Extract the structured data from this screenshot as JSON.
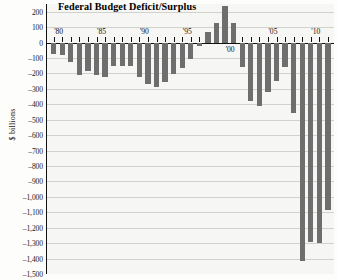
{
  "chart_data": {
    "type": "bar",
    "title": "Federal Budget Deficit/Surplus",
    "xlabel": "",
    "ylabel": "$ billions",
    "ylim": [
      -1500,
      250
    ],
    "ytick_step": 100,
    "grid": true,
    "legend": "none",
    "bar_color": "#6e6e6e",
    "plot_background": "#f6f6f4",
    "axis_color": "#111111",
    "ytick_labels": [
      "200",
      "100",
      "0",
      "–100",
      "–200",
      "–300",
      "–400",
      "–500",
      "–600",
      "–700",
      "–800",
      "–900",
      "–1,000",
      "–1,100",
      "–1,200",
      "–1,300",
      "–1,400",
      "–1,500"
    ],
    "ytick_values": [
      200,
      100,
      0,
      -100,
      -200,
      -300,
      -400,
      -500,
      -600,
      -700,
      -800,
      -900,
      -1000,
      -1100,
      -1200,
      -1300,
      -1400,
      -1500
    ],
    "xtick_labels": [
      "'80",
      "'85",
      "'90",
      "'95",
      "'00",
      "'05",
      "'10"
    ],
    "xtick_years": [
      1980,
      1985,
      1990,
      1995,
      2000,
      2005,
      2010
    ],
    "categories": [
      1980,
      1981,
      1982,
      1983,
      1984,
      1985,
      1986,
      1987,
      1988,
      1989,
      1990,
      1991,
      1992,
      1993,
      1994,
      1995,
      1996,
      1997,
      1998,
      1999,
      2000,
      2001,
      2002,
      2003,
      2004,
      2005,
      2006,
      2007,
      2008,
      2009,
      2010,
      2011,
      2012
    ],
    "values": [
      -74,
      -79,
      -128,
      -208,
      -185,
      -212,
      -221,
      -150,
      -155,
      -152,
      -221,
      -269,
      -290,
      -255,
      -203,
      -164,
      -107,
      -22,
      69,
      126,
      236,
      128,
      -158,
      -378,
      -413,
      -318,
      -248,
      -161,
      -459,
      -1413,
      -1294,
      -1300,
      -1087
    ]
  },
  "axis": {
    "y_label_text": "$ billions"
  }
}
